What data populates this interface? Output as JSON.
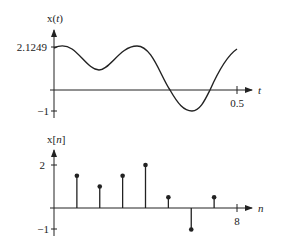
{
  "chart_data": [
    {
      "type": "line",
      "title": "",
      "ylabel": "x(t)",
      "ylabel_var": "t",
      "xlabel": "t",
      "x_ticks": [
        "0.5"
      ],
      "y_ticks": [
        "2.1249",
        "-1"
      ],
      "xlim": [
        0,
        0.5
      ],
      "ylim": [
        -1,
        2.1249
      ],
      "grid": false,
      "x": [
        0,
        0.01,
        0.05,
        0.1,
        0.15,
        0.2,
        0.25,
        0.3,
        0.35,
        0.4,
        0.45,
        0.5
      ],
      "values": [
        2.1,
        2.1249,
        1.8,
        0.93,
        1.6,
        2.1249,
        0.9,
        -0.9,
        -0.5,
        0.3,
        1.5,
        2.0
      ]
    },
    {
      "type": "stem",
      "title": "",
      "ylabel": "x[n]",
      "ylabel_var": "n",
      "xlabel": "n",
      "x_ticks": [
        "8"
      ],
      "y_ticks": [
        "2",
        "-1"
      ],
      "xlim": [
        0,
        8
      ],
      "ylim": [
        -1,
        2
      ],
      "grid": false,
      "x": [
        1,
        2,
        3,
        4,
        5,
        6,
        7
      ],
      "values": [
        1.5,
        1.0,
        1.5,
        2.0,
        0.5,
        -1.0,
        0.5
      ]
    }
  ],
  "top": {
    "ylabel_pre": "x(",
    "ylabel_var": "t",
    "ylabel_post": ")",
    "ytick_top": "2.1249",
    "ytick_bottom": "−1",
    "xtick": "0.5",
    "xlabel": "t"
  },
  "bottom": {
    "ylabel_pre": "x[",
    "ylabel_var": "n",
    "ylabel_post": "]",
    "ytick_top": "2",
    "ytick_bottom": "−1",
    "xtick": "8",
    "xlabel": "n"
  }
}
